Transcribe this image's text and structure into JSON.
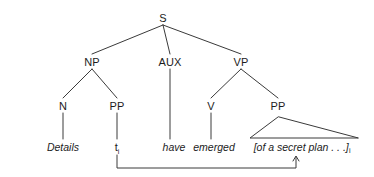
{
  "figure": {
    "type": "syntax-tree",
    "colors": {
      "background": "#ffffff",
      "ink": "#1c1c1c",
      "line": "#3a3a3a"
    }
  },
  "nodes": {
    "s": {
      "label": "S",
      "x": 163,
      "y": 18
    },
    "np": {
      "label": "NP",
      "x": 92,
      "y": 62
    },
    "aux": {
      "label": "AUX",
      "x": 170,
      "y": 62
    },
    "vp": {
      "label": "VP",
      "x": 241,
      "y": 62
    },
    "n": {
      "label": "N",
      "x": 63,
      "y": 106
    },
    "pp_np": {
      "label": "PP",
      "x": 117,
      "y": 106
    },
    "v": {
      "label": "V",
      "x": 211,
      "y": 106
    },
    "pp_vp": {
      "label": "PP",
      "x": 278,
      "y": 106
    }
  },
  "leaves": {
    "details": {
      "text": "Details",
      "x": 63,
      "y": 147
    },
    "trace": {
      "text": "t",
      "subscript": "i",
      "x": 117,
      "y": 147
    },
    "have": {
      "text": "have",
      "x": 174,
      "y": 147
    },
    "emerged": {
      "text": "emerged",
      "x": 214,
      "y": 147
    },
    "pp_phrase": {
      "text": "[of a secret plan . . .]",
      "subscript": "i",
      "x": 302,
      "y": 147
    }
  },
  "triangle": {
    "apex_x": 278,
    "apex_y": 117,
    "base_left_x": 250,
    "base_right_x": 358,
    "base_y": 138
  },
  "movement_arrow": {
    "from_x": 117,
    "from_y": 155,
    "bottom_y": 168,
    "to_x": 296,
    "to_y": 157,
    "description": "coindexed movement line from trace to PP"
  }
}
